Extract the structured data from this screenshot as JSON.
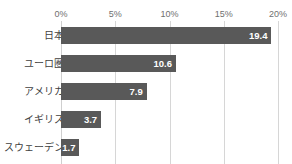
{
  "chart_data": {
    "type": "bar",
    "orientation": "horizontal",
    "title": "",
    "title_visible": false,
    "title_note": "clipped at top edge of image, illegible",
    "xlabel": "",
    "ylabel": "",
    "categories": [
      "日本",
      "ユーロ圏",
      "アメリカ",
      "イギリス",
      "スウェーデン"
    ],
    "values": [
      19.4,
      10.6,
      7.9,
      3.7,
      1.7
    ],
    "value_labels": [
      "19.4",
      "10.6",
      "7.9",
      "3.7",
      "1.7"
    ],
    "xlim": [
      0,
      20
    ],
    "xticks": [
      0,
      5,
      10,
      15,
      20
    ],
    "xtick_labels": [
      "0%",
      "5%",
      "10%",
      "15%",
      "20%"
    ],
    "xaxis_position": "top",
    "grid": true,
    "grid_axis": "x",
    "legend": false,
    "bar_color": "#595959",
    "grid_color": "#d6d6d6",
    "value_label_color": "#ffffff",
    "category_label_color": "#3f3f3f",
    "tick_label_color": "#6f6f6f",
    "background_color": "#ffffff"
  }
}
